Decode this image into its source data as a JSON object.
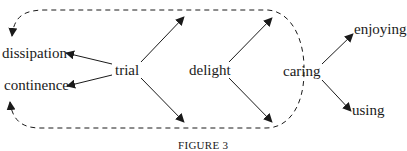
{
  "figure": {
    "caption": "FIGURE 3",
    "nodes": {
      "dissipation": "dissipation",
      "continence": "continence",
      "trial": "trial",
      "delight": "delight",
      "caring": "caring",
      "enjoying": "enjoying",
      "using": "using"
    },
    "edges": [
      {
        "from": "trial",
        "to": "dissipation",
        "style": "solid"
      },
      {
        "from": "trial",
        "to": "continence",
        "style": "solid"
      },
      {
        "from": "trial",
        "to": "upper-right",
        "style": "solid"
      },
      {
        "from": "trial",
        "to": "lower-right",
        "style": "solid"
      },
      {
        "from": "delight",
        "to": "upper-right",
        "style": "solid"
      },
      {
        "from": "delight",
        "to": "lower-right",
        "style": "solid"
      },
      {
        "from": "caring",
        "to": "enjoying",
        "style": "solid"
      },
      {
        "from": "caring",
        "to": "using",
        "style": "solid"
      },
      {
        "from": "loop",
        "to": "dissipation",
        "style": "dashed"
      },
      {
        "from": "loop",
        "to": "continence",
        "style": "dashed"
      }
    ],
    "colors": {
      "ink": "#1a1a1a",
      "background": "#ffffff"
    }
  }
}
